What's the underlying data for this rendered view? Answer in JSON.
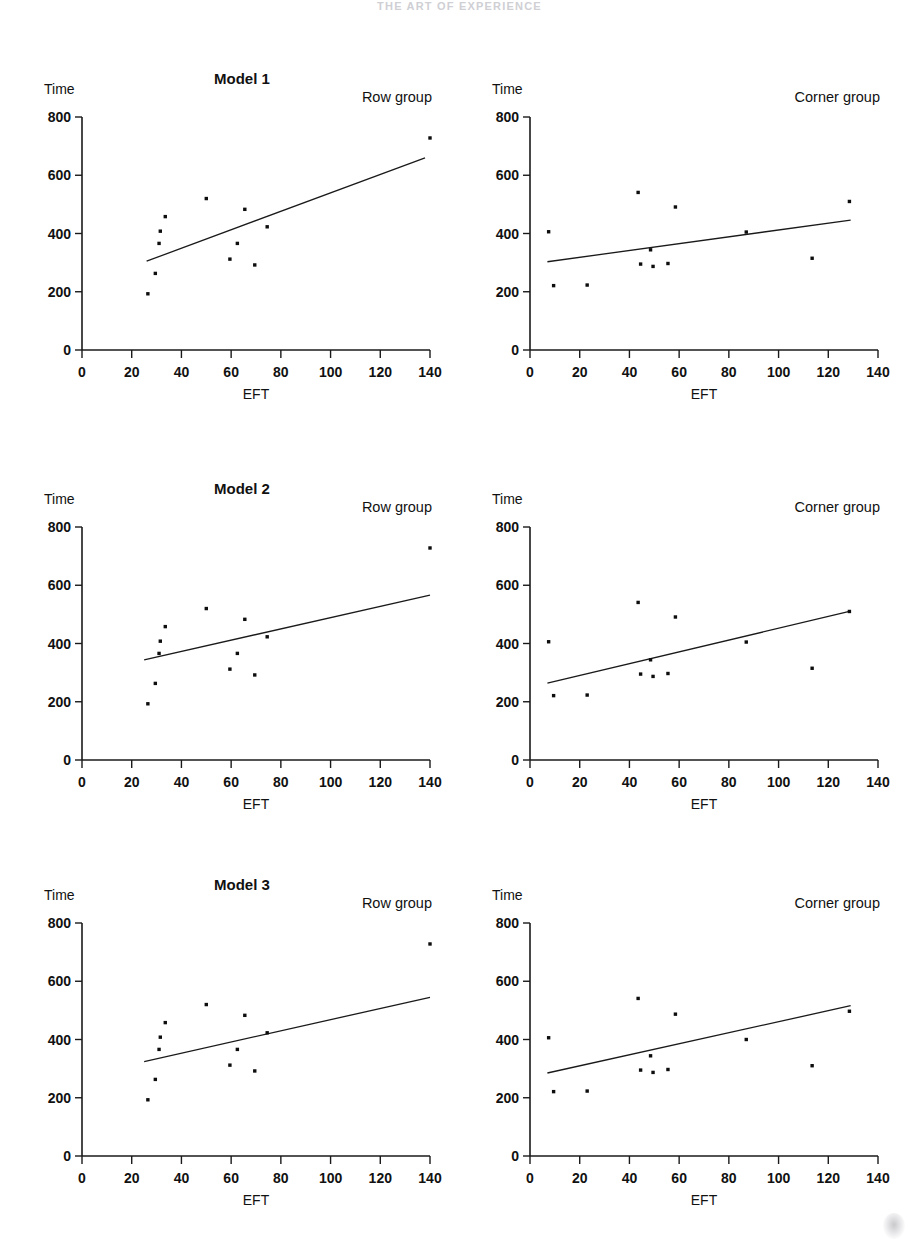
{
  "page": {
    "header_text": "THE ART OF EXPERIENCE",
    "background": "#ffffff",
    "ink": "#111111"
  },
  "axis": {
    "y_name": "Time",
    "x_name": "EFT",
    "y_ticks": [
      "800",
      "600",
      "400",
      "200",
      "0"
    ],
    "x_ticks": [
      "0",
      "20",
      "40",
      "60",
      "80",
      "100",
      "120",
      "140"
    ],
    "y_values": [
      800,
      600,
      400,
      200,
      0
    ],
    "x_values": [
      0,
      20,
      40,
      60,
      80,
      100,
      120,
      140
    ],
    "xlim": [
      0,
      140
    ],
    "ylim": [
      0,
      800
    ]
  },
  "titles": {
    "model1": "Model 1",
    "model2": "Model 2",
    "model3": "Model 3"
  },
  "groups": {
    "row": "Row group",
    "corner": "Corner group"
  },
  "chart_data": [
    {
      "id": "model1-row",
      "type": "scatter",
      "title": "Model 1",
      "annotation": "Row group",
      "xlabel": "EFT",
      "ylabel": "Time",
      "xlim": [
        0,
        140
      ],
      "ylim": [
        0,
        800
      ],
      "grid": false,
      "points": [
        {
          "x": 26.5,
          "y": 193
        },
        {
          "x": 29.5,
          "y": 263
        },
        {
          "x": 31.0,
          "y": 366
        },
        {
          "x": 31.5,
          "y": 408
        },
        {
          "x": 33.5,
          "y": 458
        },
        {
          "x": 50.0,
          "y": 520
        },
        {
          "x": 59.5,
          "y": 312
        },
        {
          "x": 62.5,
          "y": 366
        },
        {
          "x": 65.5,
          "y": 483
        },
        {
          "x": 69.5,
          "y": 292
        },
        {
          "x": 74.5,
          "y": 423
        },
        {
          "x": 140.0,
          "y": 728
        }
      ],
      "fit_line": {
        "x1": 26,
        "y1": 305,
        "x2": 138,
        "y2": 660
      }
    },
    {
      "id": "model1-corner",
      "type": "scatter",
      "title": "",
      "annotation": "Corner group",
      "xlabel": "EFT",
      "ylabel": "Time",
      "xlim": [
        0,
        140
      ],
      "ylim": [
        0,
        800
      ],
      "grid": false,
      "points": [
        {
          "x": 7.5,
          "y": 406
        },
        {
          "x": 9.5,
          "y": 221
        },
        {
          "x": 23.0,
          "y": 223
        },
        {
          "x": 43.5,
          "y": 541
        },
        {
          "x": 44.5,
          "y": 295
        },
        {
          "x": 48.5,
          "y": 344
        },
        {
          "x": 49.5,
          "y": 287
        },
        {
          "x": 55.5,
          "y": 297
        },
        {
          "x": 58.5,
          "y": 491
        },
        {
          "x": 87.0,
          "y": 405
        },
        {
          "x": 113.5,
          "y": 315
        },
        {
          "x": 128.5,
          "y": 510
        }
      ],
      "fit_line": {
        "x1": 7,
        "y1": 303,
        "x2": 129,
        "y2": 446
      }
    },
    {
      "id": "model2-row",
      "type": "scatter",
      "title": "Model 2",
      "annotation": "Row group",
      "xlabel": "EFT",
      "ylabel": "Time",
      "xlim": [
        0,
        140
      ],
      "ylim": [
        0,
        800
      ],
      "grid": false,
      "points": [
        {
          "x": 26.5,
          "y": 193
        },
        {
          "x": 29.5,
          "y": 263
        },
        {
          "x": 31.0,
          "y": 366
        },
        {
          "x": 31.5,
          "y": 408
        },
        {
          "x": 33.5,
          "y": 458
        },
        {
          "x": 50.0,
          "y": 520
        },
        {
          "x": 59.5,
          "y": 312
        },
        {
          "x": 62.5,
          "y": 366
        },
        {
          "x": 65.5,
          "y": 483
        },
        {
          "x": 69.5,
          "y": 292
        },
        {
          "x": 74.5,
          "y": 423
        },
        {
          "x": 140.0,
          "y": 728
        }
      ],
      "fit_line": {
        "x1": 25,
        "y1": 344,
        "x2": 140,
        "y2": 566
      }
    },
    {
      "id": "model2-corner",
      "type": "scatter",
      "title": "",
      "annotation": "Corner group",
      "xlabel": "EFT",
      "ylabel": "Time",
      "xlim": [
        0,
        140
      ],
      "ylim": [
        0,
        800
      ],
      "grid": false,
      "points": [
        {
          "x": 7.5,
          "y": 406
        },
        {
          "x": 9.5,
          "y": 221
        },
        {
          "x": 23.0,
          "y": 223
        },
        {
          "x": 43.5,
          "y": 541
        },
        {
          "x": 44.5,
          "y": 295
        },
        {
          "x": 48.5,
          "y": 344
        },
        {
          "x": 49.5,
          "y": 287
        },
        {
          "x": 55.5,
          "y": 297
        },
        {
          "x": 58.5,
          "y": 491
        },
        {
          "x": 87.0,
          "y": 405
        },
        {
          "x": 113.5,
          "y": 315
        },
        {
          "x": 128.5,
          "y": 510
        }
      ],
      "fit_line": {
        "x1": 7,
        "y1": 264,
        "x2": 128.5,
        "y2": 510
      }
    },
    {
      "id": "model3-row",
      "type": "scatter",
      "title": "Model 3",
      "annotation": "Row group",
      "xlabel": "EFT",
      "ylabel": "Time",
      "xlim": [
        0,
        140
      ],
      "ylim": [
        0,
        800
      ],
      "grid": false,
      "points": [
        {
          "x": 26.5,
          "y": 193
        },
        {
          "x": 29.5,
          "y": 263
        },
        {
          "x": 31.0,
          "y": 366
        },
        {
          "x": 31.5,
          "y": 408
        },
        {
          "x": 33.5,
          "y": 458
        },
        {
          "x": 50.0,
          "y": 520
        },
        {
          "x": 59.5,
          "y": 312
        },
        {
          "x": 62.5,
          "y": 366
        },
        {
          "x": 65.5,
          "y": 483
        },
        {
          "x": 69.5,
          "y": 292
        },
        {
          "x": 74.5,
          "y": 423
        },
        {
          "x": 140.0,
          "y": 728
        }
      ],
      "fit_line": {
        "x1": 25,
        "y1": 324,
        "x2": 140,
        "y2": 545
      }
    },
    {
      "id": "model3-corner",
      "type": "scatter",
      "title": "",
      "annotation": "Corner group",
      "xlabel": "EFT",
      "ylabel": "Time",
      "xlim": [
        0,
        140
      ],
      "ylim": [
        0,
        800
      ],
      "grid": false,
      "points": [
        {
          "x": 7.5,
          "y": 406
        },
        {
          "x": 9.5,
          "y": 221
        },
        {
          "x": 23.0,
          "y": 223
        },
        {
          "x": 43.5,
          "y": 541
        },
        {
          "x": 44.5,
          "y": 295
        },
        {
          "x": 48.5,
          "y": 344
        },
        {
          "x": 49.5,
          "y": 287
        },
        {
          "x": 55.5,
          "y": 297
        },
        {
          "x": 58.5,
          "y": 487
        },
        {
          "x": 87.0,
          "y": 400
        },
        {
          "x": 113.5,
          "y": 310
        },
        {
          "x": 128.5,
          "y": 497
        }
      ],
      "fit_line": {
        "x1": 7,
        "y1": 285,
        "x2": 129,
        "y2": 516
      }
    }
  ]
}
